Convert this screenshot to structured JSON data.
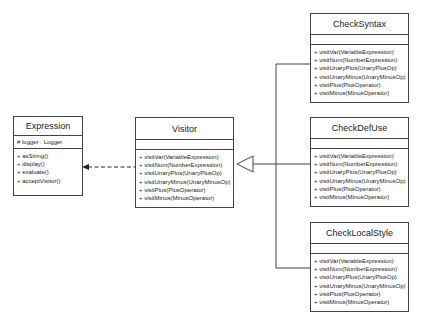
{
  "classes": {
    "expression": {
      "name": "Expression",
      "attributes": [
        "# logger : Logger"
      ],
      "operations": [
        "+ asString()",
        "+ display()",
        "+ evaluate()",
        "+ acceptVisitor()"
      ]
    },
    "visitor": {
      "name": "Visitor",
      "attributes": [],
      "operations": [
        "+ visitVar(VariableExpression)",
        "+ visitNum(NumberExpression)",
        "+ visitUnaryPlus(UnaryPlusOp)",
        "+ visitUnaryMinus(UnaryMinusOp)",
        "+ visitPlus(PlusOperator)",
        "+ visitMinus(MinusOperator)"
      ]
    },
    "check_syntax": {
      "name": "CheckSyntax",
      "attributes": [],
      "operations": [
        "+ visitVar(VariableExpression)",
        "+ visitNum(NumberExpression)",
        "+ visitUnaryPlus(UnaryPlusOp)",
        "+ visitUnaryMinus(UnaryMinusOp)",
        "+ visitPlus(PlusOperator)",
        "+ visitMinus(MinusOperator)"
      ]
    },
    "check_def_use": {
      "name": "CheckDefUse",
      "attributes": [],
      "operations": [
        "+ visitVar(VariableExpression)",
        "+ visitNum(NumberExpression)",
        "+ visitUnaryPlus(UnaryPlusOp)",
        "+ visitUnaryMinus(UnaryMinusOp)",
        "+ visitPlus(PlusOperator)",
        "+ visitMinus(MinusOperator)"
      ]
    },
    "check_local_style": {
      "name": "CheckLocalStyle",
      "attributes": [],
      "operations": [
        "+ visitVar(VariableExpression)",
        "+ visitNum(NumberExpression)",
        "+ visitUnaryPlus(UnaryPlusOp)",
        "+ visitUnaryMinus(UnaryMinusOp)",
        "+ visitPlus(PlusOperator)",
        "+ visitMinus(MinusOperator)"
      ]
    }
  },
  "relationships": [
    {
      "type": "dependency",
      "from": "Visitor",
      "to": "Expression"
    },
    {
      "type": "generalization",
      "from": "CheckSyntax",
      "to": "Visitor"
    },
    {
      "type": "generalization",
      "from": "CheckDefUse",
      "to": "Visitor"
    },
    {
      "type": "generalization",
      "from": "CheckLocalStyle",
      "to": "Visitor"
    }
  ]
}
